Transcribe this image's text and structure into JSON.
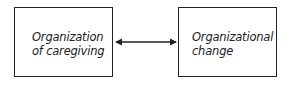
{
  "diagram": {
    "nodes": [
      {
        "id": "caregiving",
        "lines": [
          "Organization",
          "of caregiving"
        ]
      },
      {
        "id": "change",
        "lines": [
          "Organizational",
          "change"
        ]
      }
    ],
    "edges": [
      {
        "from": "caregiving",
        "to": "change",
        "direction": "bidirectional"
      }
    ],
    "colors": {
      "stroke": "#222222",
      "background": "#ffffff"
    }
  }
}
